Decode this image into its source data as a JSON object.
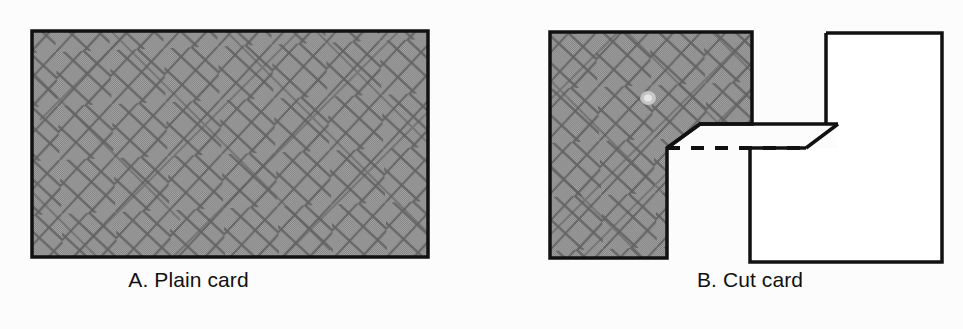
{
  "figure": {
    "background_color": "#fcfcfc",
    "ink_color": "#111111",
    "shade_color": "#969696",
    "hatch_color": "#5a5a5a",
    "panels": [
      {
        "id": "A",
        "caption": "A. Plain card",
        "shape": "rectangle",
        "description": "Plain rectangular card, fully shaded with diagonal crosshatch texture",
        "rect": {
          "x": 32,
          "y": 31,
          "width": 396,
          "height": 226
        }
      },
      {
        "id": "B",
        "caption": "B. Cut card",
        "shape": "cut-card",
        "description": "Card cut into two pieces: an L-shaped shaded piece on the left and a white notched piece on the right, with a parallelogram cut flap and dashed fold line",
        "shaded_piece": {
          "top_section": {
            "x": 550,
            "y": 32,
            "width": 202,
            "height": 92
          },
          "lower_section": {
            "x": 550,
            "y": 124,
            "width": 117,
            "height": 134
          }
        },
        "white_piece": {
          "x": 826,
          "y": 33,
          "width": 116,
          "height": 229
        },
        "dashed_fold_line": {
          "x1": 668,
          "y1": 148,
          "x2": 838,
          "y2": 148
        }
      }
    ]
  },
  "labels": {
    "panel_a": "A. Plain card",
    "panel_b": "B. Cut card"
  }
}
